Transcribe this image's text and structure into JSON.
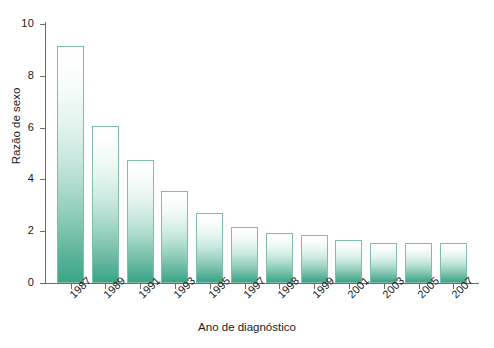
{
  "chart_data": {
    "type": "bar",
    "title": "",
    "xlabel": "Ano de diagnóstico",
    "ylabel": "Razão de sexo",
    "categories": [
      "1987",
      "1989",
      "1991",
      "1993",
      "1995",
      "1997",
      "1998",
      "1999",
      "2001",
      "2003",
      "2005",
      "2007"
    ],
    "values": [
      9.15,
      6.05,
      4.75,
      3.55,
      2.7,
      2.15,
      1.95,
      1.85,
      1.65,
      1.55,
      1.55,
      1.55
    ],
    "ylim": [
      0,
      10
    ],
    "yticks": [
      "0",
      "2",
      "4",
      "6",
      "8",
      "10"
    ],
    "ytick_values": [
      0,
      2,
      4,
      6,
      8,
      10
    ],
    "grid": false,
    "legend": null,
    "series": [
      {
        "name": "Razão de sexo",
        "values": [
          9.15,
          6.05,
          4.75,
          3.55,
          2.7,
          2.15,
          1.95,
          1.85,
          1.65,
          1.55,
          1.55,
          1.55
        ]
      }
    ],
    "colors": {
      "bar_gradient_top": "#ffffff",
      "bar_gradient_bottom": "#3ba585",
      "bar_border": "#7fbcab",
      "axis": "#6b6b6b",
      "text": "#1a1a1a",
      "background": "#ffffff"
    }
  }
}
